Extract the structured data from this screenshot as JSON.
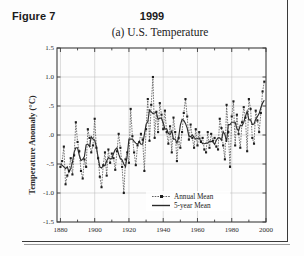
{
  "header": {
    "figure_label": "Figure 7",
    "year": "1999"
  },
  "chart_title": "(a)  U.S. Temperature",
  "axes": {
    "ylabel": "Temperature Anomaly (°C)",
    "ytick_labels": [
      "1.5",
      "1.0",
      ".5",
      ".0",
      "-.5",
      "-1.0",
      "-1.5"
    ],
    "ytick_values": [
      1.5,
      1.0,
      0.5,
      0.0,
      -0.5,
      -1.0,
      -1.5
    ],
    "xtick_labels": [
      "1880",
      "1900",
      "1920",
      "1940",
      "1960",
      "1980",
      "2000"
    ],
    "xtick_values": [
      1880,
      1900,
      1920,
      1940,
      1960,
      1980,
      2000
    ]
  },
  "legend": {
    "items": [
      {
        "label": "Annual Mean",
        "style": "dotted-marker",
        "color": "#3a3a3a"
      },
      {
        "label": "5-year Mean",
        "style": "solid",
        "color": "#2b2b2b"
      }
    ]
  },
  "chart_data": {
    "type": "line",
    "title": "(a)  U.S. Temperature",
    "xlabel": "",
    "ylabel": "Temperature Anomaly (°C)",
    "xlim": [
      1878,
      2000
    ],
    "ylim": [
      -1.5,
      1.5
    ],
    "grid": true,
    "legend_position": "bottom-center",
    "x": [
      1880,
      1881,
      1882,
      1883,
      1884,
      1885,
      1886,
      1887,
      1888,
      1889,
      1890,
      1891,
      1892,
      1893,
      1894,
      1895,
      1896,
      1897,
      1898,
      1899,
      1900,
      1901,
      1902,
      1903,
      1904,
      1905,
      1906,
      1907,
      1908,
      1909,
      1910,
      1911,
      1912,
      1913,
      1914,
      1915,
      1916,
      1917,
      1918,
      1919,
      1920,
      1921,
      1922,
      1923,
      1924,
      1925,
      1926,
      1927,
      1928,
      1929,
      1930,
      1931,
      1932,
      1933,
      1934,
      1935,
      1936,
      1937,
      1938,
      1939,
      1940,
      1941,
      1942,
      1943,
      1944,
      1945,
      1946,
      1947,
      1948,
      1949,
      1950,
      1951,
      1952,
      1953,
      1954,
      1955,
      1956,
      1957,
      1958,
      1959,
      1960,
      1961,
      1962,
      1963,
      1964,
      1965,
      1966,
      1967,
      1968,
      1969,
      1970,
      1971,
      1972,
      1973,
      1974,
      1975,
      1976,
      1977,
      1978,
      1979,
      1980,
      1981,
      1982,
      1983,
      1984,
      1985,
      1986,
      1987,
      1988,
      1989,
      1990,
      1991,
      1992,
      1993,
      1994,
      1995,
      1996,
      1997,
      1998,
      1999
    ],
    "series": [
      {
        "name": "Annual Mean",
        "style": "dotted-marker",
        "values": [
          -0.55,
          -0.45,
          -0.2,
          -0.85,
          -0.7,
          -0.62,
          -0.4,
          -0.68,
          -0.35,
          0.22,
          -0.12,
          -0.28,
          -0.62,
          -0.75,
          -0.42,
          -0.55,
          0.1,
          -0.05,
          -0.3,
          -0.18,
          0.28,
          -0.22,
          -0.4,
          -0.72,
          -0.9,
          -0.52,
          -0.3,
          -0.7,
          -0.25,
          -0.48,
          -0.32,
          -0.4,
          -0.6,
          -0.28,
          0.02,
          -0.22,
          -0.55,
          -1.0,
          -0.42,
          -0.3,
          -0.48,
          0.45,
          -0.02,
          -0.3,
          -0.52,
          -0.18,
          -0.12,
          0.02,
          -0.08,
          -0.62,
          0.1,
          0.62,
          -0.1,
          0.52,
          1.0,
          -0.05,
          0.4,
          0.05,
          0.55,
          0.35,
          0.1,
          0.42,
          0.05,
          -0.15,
          0.15,
          -0.3,
          0.3,
          0.05,
          -0.45,
          -0.05,
          -0.22,
          0.05,
          0.38,
          0.62,
          0.32,
          -0.08,
          0.18,
          -0.05,
          -0.22,
          0.1,
          -0.18,
          0.05,
          -0.12,
          -0.05,
          -0.25,
          -0.3,
          0.05,
          -0.22,
          0.02,
          -0.1,
          -0.05,
          -0.2,
          -0.25,
          0.28,
          0.12,
          -0.18,
          -0.42,
          0.52,
          0.05,
          -0.55,
          0.32,
          0.58,
          -0.18,
          0.35,
          0.02,
          -0.22,
          0.22,
          0.48,
          0.3,
          -0.28,
          0.62,
          0.45,
          -0.05,
          -0.15,
          0.42,
          0.25,
          0.05,
          0.38,
          0.75,
          0.92
        ]
      },
      {
        "name": "5-year Mean",
        "style": "solid",
        "values": [
          -0.5,
          -0.52,
          -0.55,
          -0.58,
          -0.55,
          -0.64,
          -0.58,
          -0.47,
          -0.3,
          -0.22,
          -0.22,
          -0.35,
          -0.44,
          -0.42,
          -0.37,
          -0.17,
          -0.16,
          -0.2,
          -0.03,
          -0.07,
          -0.09,
          -0.21,
          -0.39,
          -0.55,
          -0.57,
          -0.53,
          -0.53,
          -0.45,
          -0.39,
          -0.41,
          -0.41,
          -0.32,
          -0.25,
          -0.22,
          -0.33,
          -0.41,
          -0.43,
          -0.5,
          -0.55,
          -0.35,
          -0.07,
          -0.07,
          -0.07,
          -0.11,
          -0.14,
          -0.16,
          -0.12,
          -0.16,
          -0.16,
          0.01,
          0.18,
          0.23,
          0.43,
          0.4,
          0.37,
          0.38,
          0.39,
          0.27,
          0.29,
          0.29,
          0.21,
          0.1,
          0.11,
          0.03,
          0.01,
          0.07,
          -0.07,
          -0.07,
          -0.14,
          -0.04,
          0.17,
          0.27,
          0.25,
          0.2,
          0.12,
          -0.02,
          -0.03,
          0.0,
          -0.04,
          -0.07,
          -0.06,
          -0.05,
          -0.11,
          -0.15,
          -0.15,
          -0.14,
          -0.14,
          -0.11,
          -0.11,
          -0.12,
          -0.16,
          -0.09,
          -0.05,
          -0.05,
          -0.09,
          0.06,
          0.01,
          -0.12,
          0.18,
          0.18,
          0.22,
          0.22,
          0.22,
          0.11,
          0.07,
          0.17,
          0.16,
          0.22,
          0.32,
          0.41,
          0.26,
          0.26,
          0.18,
          0.19,
          0.27,
          0.32,
          0.37,
          0.47,
          0.55,
          0.6
        ]
      }
    ]
  }
}
